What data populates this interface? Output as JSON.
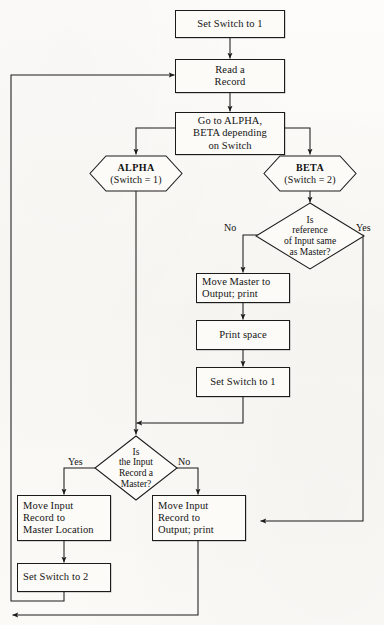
{
  "diagram": {
    "type": "flowchart",
    "canvas": {
      "width": 384,
      "height": 625
    },
    "style": {
      "line_color": "#1b1b1b",
      "text_color": "#141414",
      "paper_color": "#fbfaf7"
    }
  },
  "nodes": {
    "set_switch_1_top": {
      "shape": "process",
      "text": "Set Switch to 1"
    },
    "read_record": {
      "shape": "process",
      "line1": "Read a",
      "line2": "Record"
    },
    "go_to": {
      "shape": "process",
      "line1": "Go to ALPHA,",
      "line2": "BETA depending",
      "line3": "on Switch"
    },
    "alpha": {
      "shape": "hexagon",
      "name": "ALPHA",
      "condition": "(Switch = 1)"
    },
    "beta": {
      "shape": "hexagon",
      "name": "BETA",
      "condition": "(Switch = 2)"
    },
    "decision_reference": {
      "shape": "decision",
      "line1": "Is",
      "line2": "reference",
      "line3": "of Input same",
      "line4": "as Master?",
      "branch_left": "No",
      "branch_right": "Yes"
    },
    "move_master_output": {
      "shape": "process",
      "line1": "Move Master to",
      "line2": "Output; print"
    },
    "print_space": {
      "shape": "process",
      "text": "Print space"
    },
    "set_switch_1_mid": {
      "shape": "process",
      "text": "Set Switch to 1"
    },
    "decision_master": {
      "shape": "decision",
      "line1": "Is",
      "line2": "the Input",
      "line3": "Record a",
      "line4": "Master?",
      "branch_left": "Yes",
      "branch_right": "No"
    },
    "move_input_master_loc": {
      "shape": "process",
      "line1": "Move Input",
      "line2": "Record to",
      "line3": "Master Location"
    },
    "set_switch_2": {
      "shape": "process",
      "text": "Set Switch to 2"
    },
    "move_input_output": {
      "shape": "process",
      "line1": "Move Input",
      "line2": "Record to",
      "line3": "Output; print"
    }
  },
  "edge_labels": {
    "ref_no": "No",
    "ref_yes": "Yes",
    "master_yes": "Yes",
    "master_no": "No"
  }
}
